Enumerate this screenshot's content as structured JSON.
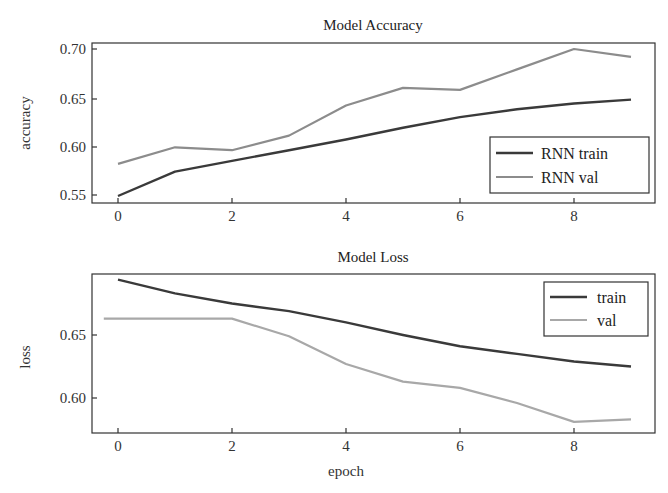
{
  "chart_data": [
    {
      "type": "line",
      "title": "Model Accuracy",
      "xlabel": "",
      "ylabel": "accuracy",
      "x": [
        0,
        1,
        2,
        3,
        4,
        5,
        6,
        7,
        8,
        9
      ],
      "xticks": [
        "0",
        "2",
        "4",
        "6",
        "8"
      ],
      "yticks": [
        "0.55",
        "0.60",
        "0.65",
        "0.70"
      ],
      "ylim": [
        0.545,
        0.706
      ],
      "xlim": [
        -0.45,
        9.45
      ],
      "grid": false,
      "legend_position": "lower right",
      "series": [
        {
          "name": "RNN train",
          "color": "#3a3a3a",
          "values": [
            0.549,
            0.574,
            0.585,
            0.596,
            0.607,
            0.619,
            0.63,
            0.638,
            0.644,
            0.648
          ]
        },
        {
          "name": "RNN val",
          "color": "#8c8c8c",
          "values": [
            0.582,
            0.599,
            0.596,
            0.611,
            0.642,
            0.66,
            0.658,
            0.679,
            0.7,
            0.692
          ]
        }
      ]
    },
    {
      "type": "line",
      "title": "Model Loss",
      "xlabel": "epoch",
      "ylabel": "loss",
      "x": [
        0,
        1,
        2,
        3,
        4,
        5,
        6,
        7,
        8,
        9
      ],
      "xticks": [
        "0",
        "2",
        "4",
        "6",
        "8"
      ],
      "yticks": [
        "0.60",
        "0.65"
      ],
      "ylim": [
        0.572,
        0.699
      ],
      "xlim": [
        -0.45,
        9.45
      ],
      "grid": false,
      "legend_position": "upper right",
      "series": [
        {
          "name": "train",
          "color": "#3a3a3a",
          "values": [
            0.694,
            0.683,
            0.675,
            0.669,
            0.66,
            0.65,
            0.641,
            0.635,
            0.629,
            0.625
          ]
        },
        {
          "name": "val",
          "color": "#a8a8a8",
          "x": [
            -0.25,
            2,
            3,
            4,
            5,
            6,
            7,
            8,
            9
          ],
          "values": [
            0.663,
            0.663,
            0.649,
            0.627,
            0.613,
            0.608,
            0.596,
            0.581,
            0.583
          ]
        }
      ]
    }
  ],
  "top": {
    "title": "Model Accuracy",
    "ylabel": "accuracy",
    "yticks": [
      "0.70",
      "0.65",
      "0.60",
      "0.55"
    ],
    "xticks": [
      "0",
      "2",
      "4",
      "6",
      "8"
    ],
    "legend": [
      "RNN train",
      "RNN val"
    ]
  },
  "bottom": {
    "title": "Model Loss",
    "ylabel": "loss",
    "xlabel": "epoch",
    "yticks": [
      "0.65",
      "0.60"
    ],
    "xticks": [
      "0",
      "2",
      "4",
      "6",
      "8"
    ],
    "legend": [
      "train",
      "val"
    ]
  }
}
